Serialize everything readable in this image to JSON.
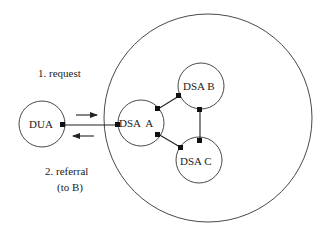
{
  "diagram": {
    "type": "directory-referral",
    "domain_boundary": {
      "cx": 208,
      "cy": 118,
      "r": 104
    },
    "nodes": [
      {
        "id": "dua",
        "label": "DUA",
        "cx": 42,
        "cy": 124,
        "r": 23
      },
      {
        "id": "dsa_a",
        "label": "DSA  A",
        "cx": 141,
        "cy": 123,
        "r": 23
      },
      {
        "id": "dsa_b",
        "label": "DSA B",
        "cx": 201,
        "cy": 86,
        "r": 23
      },
      {
        "id": "dsa_c",
        "label": "DSA C",
        "cx": 199,
        "cy": 160,
        "r": 23
      }
    ],
    "edges": [
      {
        "from": "dua",
        "to": "dsa_a"
      },
      {
        "from": "dsa_a",
        "to": "dsa_b"
      },
      {
        "from": "dsa_a",
        "to": "dsa_c"
      },
      {
        "from": "dsa_b",
        "to": "dsa_c"
      }
    ],
    "annotations": {
      "request": "1. request",
      "referral_line1": "2. referral",
      "referral_line2": "(to B)"
    },
    "colors": {
      "stroke": "#333333",
      "text": "#222222",
      "background": "#ffffff"
    }
  }
}
